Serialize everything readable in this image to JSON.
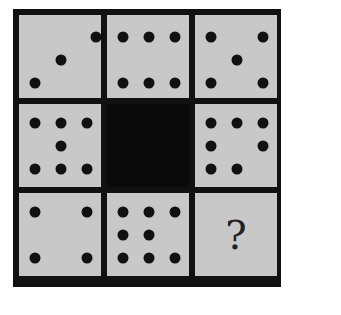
{
  "puzzle": {
    "rows": 3,
    "cols": 3,
    "colors": {
      "border": "#111111",
      "cell": "#c8c8c8",
      "center": "#0a0a0a",
      "dot": "#111111"
    },
    "cells": [
      {
        "id": "r1c1",
        "count": 3,
        "dots": [
          [
            77,
            22
          ],
          [
            42,
            45
          ],
          [
            16,
            68
          ]
        ]
      },
      {
        "id": "r1c2",
        "count": 6,
        "dots": [
          [
            16,
            22
          ],
          [
            42,
            22
          ],
          [
            68,
            22
          ],
          [
            16,
            68
          ],
          [
            42,
            68
          ],
          [
            68,
            68
          ]
        ]
      },
      {
        "id": "r1c3",
        "count": 5,
        "dots": [
          [
            16,
            22
          ],
          [
            68,
            22
          ],
          [
            42,
            45
          ],
          [
            16,
            68
          ],
          [
            68,
            68
          ]
        ]
      },
      {
        "id": "r2c1",
        "count": 7,
        "dots": [
          [
            16,
            19
          ],
          [
            42,
            19
          ],
          [
            68,
            19
          ],
          [
            42,
            42
          ],
          [
            16,
            65
          ],
          [
            42,
            65
          ],
          [
            68,
            65
          ]
        ]
      },
      {
        "id": "r2c2",
        "count": null,
        "black": true
      },
      {
        "id": "r2c3",
        "count": 7,
        "dots": [
          [
            16,
            19
          ],
          [
            42,
            19
          ],
          [
            68,
            19
          ],
          [
            16,
            42
          ],
          [
            68,
            42
          ],
          [
            16,
            65
          ],
          [
            42,
            65
          ]
        ]
      },
      {
        "id": "r3c1",
        "count": 4,
        "dots": [
          [
            16,
            19
          ],
          [
            68,
            19
          ],
          [
            16,
            65
          ],
          [
            68,
            65
          ]
        ]
      },
      {
        "id": "r3c2",
        "count": 8,
        "dots": [
          [
            16,
            19
          ],
          [
            42,
            19
          ],
          [
            68,
            19
          ],
          [
            16,
            42
          ],
          [
            42,
            42
          ],
          [
            16,
            65
          ],
          [
            42,
            65
          ],
          [
            68,
            65
          ]
        ]
      },
      {
        "id": "r3c3",
        "count": null,
        "question": "?"
      }
    ]
  }
}
